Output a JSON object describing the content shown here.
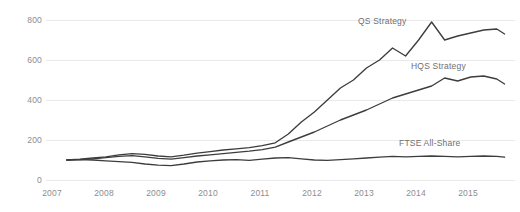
{
  "chart_data": {
    "type": "line",
    "title": "",
    "subtitle": "",
    "xlabel": "",
    "ylabel": "",
    "xlim": [
      2006.6,
      2015.6
    ],
    "ylim": [
      0,
      800
    ],
    "grid": true,
    "gridlines_horizontal_only": true,
    "legend_position": "inline-labels",
    "line_color": "#3d3d3d",
    "gridline_color": "#e9e9ec",
    "tick_label_color": "#8d8d8d",
    "background": "#ffffff",
    "x_ticks": [
      "2007",
      "2008",
      "2009",
      "2010",
      "2011",
      "2012",
      "2013",
      "2014",
      "2015"
    ],
    "y_ticks": [
      "0",
      "200",
      "400",
      "600",
      "800"
    ],
    "series": [
      {
        "name": "QS Strategy",
        "label": "QS Strategy",
        "x": [
          2007.0,
          2007.25,
          2007.5,
          2007.75,
          2008.0,
          2008.25,
          2008.5,
          2008.75,
          2009.0,
          2009.25,
          2009.5,
          2009.75,
          2010.0,
          2010.25,
          2010.5,
          2010.75,
          2011.0,
          2011.25,
          2011.5,
          2011.75,
          2012.0,
          2012.25,
          2012.5,
          2012.75,
          2013.0,
          2013.25,
          2013.5,
          2013.75,
          2014.0,
          2014.25,
          2014.5,
          2014.75,
          2015.0,
          2015.25,
          2015.4
        ],
        "values": [
          100,
          104,
          110,
          116,
          126,
          132,
          128,
          120,
          116,
          124,
          134,
          142,
          150,
          156,
          162,
          172,
          186,
          230,
          290,
          340,
          400,
          460,
          500,
          560,
          600,
          660,
          620,
          700,
          790,
          700,
          720,
          735,
          750,
          755,
          730
        ]
      },
      {
        "name": "HQS Strategy",
        "label": "HQS Strategy",
        "x": [
          2007.0,
          2007.25,
          2007.5,
          2007.75,
          2008.0,
          2008.25,
          2008.5,
          2008.75,
          2009.0,
          2009.25,
          2009.5,
          2009.75,
          2010.0,
          2010.25,
          2010.5,
          2010.75,
          2011.0,
          2011.25,
          2011.5,
          2011.75,
          2012.0,
          2012.25,
          2012.5,
          2012.75,
          2013.0,
          2013.25,
          2013.5,
          2013.75,
          2014.0,
          2014.25,
          2014.5,
          2014.75,
          2015.0,
          2015.25,
          2015.4
        ],
        "values": [
          100,
          102,
          106,
          112,
          118,
          122,
          116,
          108,
          104,
          112,
          120,
          126,
          132,
          138,
          144,
          152,
          164,
          190,
          215,
          240,
          270,
          300,
          325,
          350,
          380,
          410,
          430,
          450,
          470,
          510,
          495,
          515,
          520,
          505,
          480
        ]
      },
      {
        "name": "FTSE All-Share",
        "label": "FTSE All-Share",
        "x": [
          2007.0,
          2007.25,
          2007.5,
          2007.75,
          2008.0,
          2008.25,
          2008.5,
          2008.75,
          2009.0,
          2009.25,
          2009.5,
          2009.75,
          2010.0,
          2010.25,
          2010.5,
          2010.75,
          2011.0,
          2011.25,
          2011.5,
          2011.75,
          2012.0,
          2012.25,
          2012.5,
          2012.75,
          2013.0,
          2013.25,
          2013.5,
          2013.75,
          2014.0,
          2014.25,
          2014.5,
          2014.75,
          2015.0,
          2015.25,
          2015.4
        ],
        "values": [
          100,
          102,
          100,
          96,
          92,
          88,
          80,
          74,
          72,
          80,
          90,
          96,
          100,
          102,
          98,
          104,
          110,
          112,
          106,
          100,
          98,
          102,
          106,
          110,
          114,
          118,
          116,
          118,
          120,
          118,
          116,
          118,
          120,
          118,
          114
        ]
      }
    ]
  },
  "labels": {
    "qs": "QS Strategy",
    "hqs": "HQS Strategy",
    "ftse": "FTSE All-Share"
  }
}
